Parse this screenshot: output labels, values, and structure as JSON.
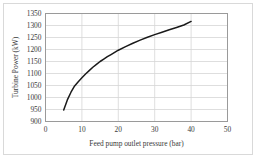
{
  "chart_data": {
    "type": "line",
    "title": "",
    "xlabel": "Feed pump outlet pressure (bar)",
    "ylabel": "Turbine Power (kW)",
    "xlim": [
      0,
      50
    ],
    "ylim": [
      900,
      1350
    ],
    "xticks": [
      0,
      10,
      20,
      30,
      40,
      50
    ],
    "yticks": [
      900,
      950,
      1000,
      1050,
      1100,
      1150,
      1200,
      1250,
      1300,
      1350
    ],
    "xtick_labels": [
      "0",
      "10",
      "20",
      "30",
      "40",
      "50"
    ],
    "ytick_labels": [
      "900",
      "950",
      "1000",
      "1050",
      "1100",
      "1150",
      "1200",
      "1250",
      "1300",
      "1350"
    ],
    "grid": "horizontal-and-vertical",
    "legend": "none",
    "series": [
      {
        "name": "Turbine Power",
        "color": "#1a1a1a",
        "x": [
          5,
          6,
          7,
          8,
          9,
          10,
          11,
          12,
          13,
          14,
          15,
          16,
          17,
          18,
          19,
          20,
          22,
          24,
          26,
          28,
          30,
          32,
          34,
          36,
          38,
          40
        ],
        "y": [
          948,
          990,
          1022,
          1048,
          1066,
          1082,
          1098,
          1112,
          1126,
          1138,
          1150,
          1160,
          1170,
          1179,
          1188,
          1197,
          1212,
          1226,
          1239,
          1251,
          1262,
          1272,
          1282,
          1292,
          1302,
          1317
        ]
      }
    ]
  },
  "axis_colors": {
    "plot_border": "#9a9a9a",
    "gridline": "#d5d5d5",
    "curve": "#1a1a1a",
    "text": "#3a3a3a"
  }
}
